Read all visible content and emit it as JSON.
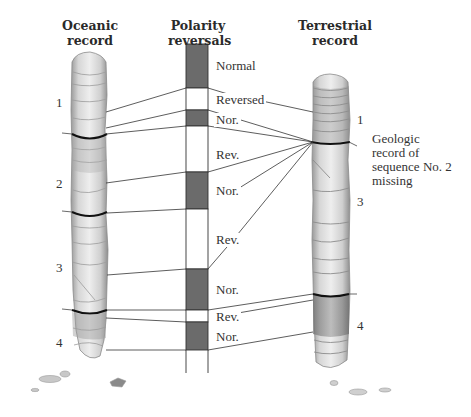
{
  "headers": {
    "oceanic": [
      "Oceanic",
      "record"
    ],
    "polarity": [
      "Polarity",
      "reversals"
    ],
    "terrestrial": [
      "Terrestrial",
      "record"
    ]
  },
  "polarity_bar": {
    "x_left": 186,
    "x_right": 208,
    "top": 44,
    "tail_bottom": 373,
    "normal_color": "#6b6b6b",
    "reversed_color": "#ffffff",
    "segments": [
      {
        "polarity": "normal",
        "label": "Normal",
        "y0": 44,
        "y1": 88,
        "label_y": 59
      },
      {
        "polarity": "reversed",
        "label": "Reversed",
        "y0": 88,
        "y1": 110,
        "label_y": 93
      },
      {
        "polarity": "normal",
        "label": "Nor.",
        "y0": 110,
        "y1": 126,
        "label_y": 113
      },
      {
        "polarity": "reversed",
        "label": "Rev.",
        "y0": 126,
        "y1": 172,
        "label_y": 148
      },
      {
        "polarity": "normal",
        "label": "Nor.",
        "y0": 172,
        "y1": 209,
        "label_y": 184
      },
      {
        "polarity": "reversed",
        "label": "Rev.",
        "y0": 209,
        "y1": 269,
        "label_y": 233
      },
      {
        "polarity": "normal",
        "label": "Nor.",
        "y0": 269,
        "y1": 310,
        "label_y": 283
      },
      {
        "polarity": "reversed",
        "label": "Rev.",
        "y0": 310,
        "y1": 322,
        "label_y": 310
      },
      {
        "polarity": "normal",
        "label": "Nor.",
        "y0": 322,
        "y1": 350,
        "label_y": 330
      }
    ]
  },
  "oceanic_core": {
    "sequences": [
      {
        "label": "1",
        "y": 95
      },
      {
        "label": "2",
        "y": 176
      },
      {
        "label": "3",
        "y": 260
      },
      {
        "label": "4",
        "y": 335
      }
    ]
  },
  "terrestrial_core": {
    "sequences": [
      {
        "label": "1",
        "y": 112
      },
      {
        "label": "3",
        "y": 194
      },
      {
        "label": "4",
        "y": 318
      }
    ]
  },
  "annotation": {
    "lines": [
      "Geologic",
      "record of",
      "sequence No. 2",
      "missing"
    ]
  }
}
